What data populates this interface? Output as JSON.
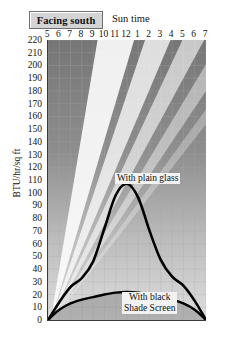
{
  "header": {
    "facing_label": "Facing south",
    "suntime_label": "Sun time"
  },
  "axes": {
    "ylabel": "BTU/hr/sq ft"
  },
  "labels": {
    "plain_glass": "With plain glass",
    "black_screen_line1": "With black",
    "black_screen_line2": "Shade Screen"
  },
  "colors": {
    "plot_bg_top": "#7d7d7d",
    "plot_bg_bottom": "#d8d8d8",
    "curve": "#000000",
    "grid": "#9a9a9a",
    "box_fill": "#d4d4d4",
    "sunbeam": "#f7f7f7"
  },
  "chart_data": {
    "type": "area",
    "title": "Facing south",
    "xlabel": "Sun time",
    "ylabel": "BTU/hr/sq ft",
    "grid": true,
    "legend": "inline-annotation",
    "xlim": [
      5,
      19
    ],
    "ylim": [
      0,
      220
    ],
    "ytick_step": 10,
    "yticks": [
      0,
      10,
      20,
      30,
      40,
      50,
      60,
      70,
      80,
      90,
      100,
      110,
      120,
      130,
      140,
      150,
      160,
      170,
      180,
      190,
      200,
      210,
      220
    ],
    "categories": [
      "5",
      "6",
      "7",
      "8",
      "9",
      "10",
      "11",
      "12",
      "1",
      "2",
      "3",
      "4",
      "5",
      "6",
      "7"
    ],
    "x": [
      5,
      6,
      7,
      8,
      9,
      10,
      11,
      12,
      13,
      14,
      15,
      16,
      17,
      18,
      19
    ],
    "series": [
      {
        "name": "With plain glass",
        "values": [
          0,
          14,
          26,
          33,
          46,
          72,
          98,
          107,
          96,
          70,
          47,
          34,
          27,
          15,
          0
        ]
      },
      {
        "name": "With black Shade Screen",
        "values": [
          0,
          8,
          13,
          16,
          18,
          20,
          21.5,
          22,
          21.5,
          20,
          18,
          16,
          13,
          8,
          0
        ]
      }
    ]
  }
}
